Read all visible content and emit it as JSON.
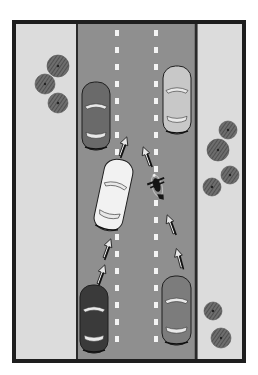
{
  "diagram": {
    "title": "",
    "colors": {
      "frame": "#1e1e1e",
      "verge": "#dcdcdc",
      "road": "#8f8f8f",
      "road_edge": "#2a2a2a",
      "lane_dash": "#f4f4f4",
      "tree": "#5a5a5a"
    },
    "lanes": 2,
    "lane_dividers": [
      {
        "x": 117,
        "dash_count": 20
      },
      {
        "x": 156,
        "dash_count": 20
      }
    ],
    "vehicles": [
      {
        "id": "car-top-left",
        "type": "car",
        "shade": "dark-gray",
        "color": "#6a6a6a",
        "x": 82,
        "y": 82,
        "w": 28,
        "h": 68,
        "angle": 0
      },
      {
        "id": "car-top-right",
        "type": "car",
        "shade": "light-gray",
        "color": "#c8c8c8",
        "x": 163,
        "y": 66,
        "w": 28,
        "h": 68,
        "angle": 0
      },
      {
        "id": "car-center-white",
        "type": "car",
        "shade": "white",
        "color": "#f2f2f2",
        "x": 99,
        "y": 159,
        "w": 29,
        "h": 72,
        "angle": 12
      },
      {
        "id": "car-bottom-left",
        "type": "car",
        "shade": "black",
        "color": "#3a3a3a",
        "x": 80,
        "y": 285,
        "w": 28,
        "h": 68,
        "angle": 0
      },
      {
        "id": "car-bottom-right",
        "type": "car",
        "shade": "gray",
        "color": "#7c7c7c",
        "x": 162,
        "y": 276,
        "w": 29,
        "h": 69,
        "angle": 0
      },
      {
        "id": "motorcycle",
        "type": "motorcycle",
        "shade": "black",
        "color": "#151515",
        "x": 157,
        "y": 186,
        "angle": -15
      }
    ],
    "arrows": [
      {
        "x": 122,
        "y": 150,
        "angle": 20
      },
      {
        "x": 148,
        "y": 160,
        "angle": -20
      },
      {
        "x": 106,
        "y": 252,
        "angle": 20
      },
      {
        "x": 100,
        "y": 278,
        "angle": 20
      },
      {
        "x": 172,
        "y": 228,
        "angle": -20
      },
      {
        "x": 180,
        "y": 262,
        "angle": -15
      }
    ],
    "trees": [
      {
        "cx": 58,
        "cy": 66,
        "r": 11
      },
      {
        "cx": 45,
        "cy": 84,
        "r": 10
      },
      {
        "cx": 58,
        "cy": 103,
        "r": 10
      },
      {
        "cx": 228,
        "cy": 130,
        "r": 9
      },
      {
        "cx": 218,
        "cy": 150,
        "r": 11
      },
      {
        "cx": 230,
        "cy": 175,
        "r": 9
      },
      {
        "cx": 212,
        "cy": 187,
        "r": 9
      },
      {
        "cx": 213,
        "cy": 311,
        "r": 9
      },
      {
        "cx": 221,
        "cy": 338,
        "r": 10
      }
    ]
  }
}
